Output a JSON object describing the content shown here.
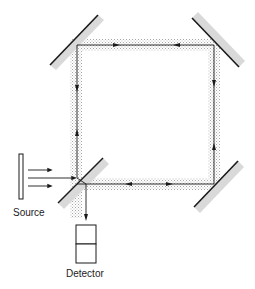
{
  "diagram": {
    "type": "ring interferometer (Sagnac)",
    "labels": {
      "source": "Source",
      "detector": "Detector"
    },
    "components": [
      {
        "name": "source",
        "kind": "light-source"
      },
      {
        "name": "beamsplitter",
        "kind": "beamsplitter",
        "position": "bottom-left"
      },
      {
        "name": "mirror-top-left",
        "kind": "mirror"
      },
      {
        "name": "mirror-top-right",
        "kind": "mirror"
      },
      {
        "name": "mirror-bottom-right",
        "kind": "mirror"
      },
      {
        "name": "detector",
        "kind": "detector"
      }
    ],
    "colors": {
      "line": "#1a1a1a",
      "mirror_fill": "#d9d9d9",
      "beam_stipple": "#bdbdbd"
    }
  }
}
